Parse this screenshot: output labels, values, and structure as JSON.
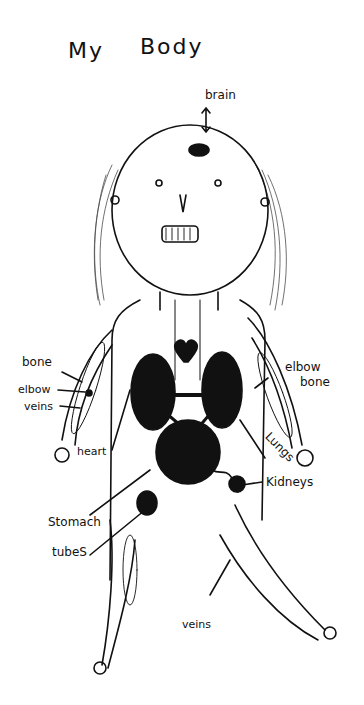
{
  "title": {
    "word1": "My",
    "word2": "Body"
  },
  "labels": {
    "brain": "brain",
    "bone_left": "bone",
    "elbow_left": "elbow",
    "veins_left": "veins",
    "heart": "heart",
    "elbow_right": "elbow",
    "bone_right": "bone",
    "lungs": "Lungs",
    "kidneys": "Kidneys",
    "stomach": "Stomach",
    "tubes": "tubeS",
    "veins_leg": "veins"
  },
  "colors": {
    "ink": "#111111",
    "paper": "#ffffff"
  }
}
